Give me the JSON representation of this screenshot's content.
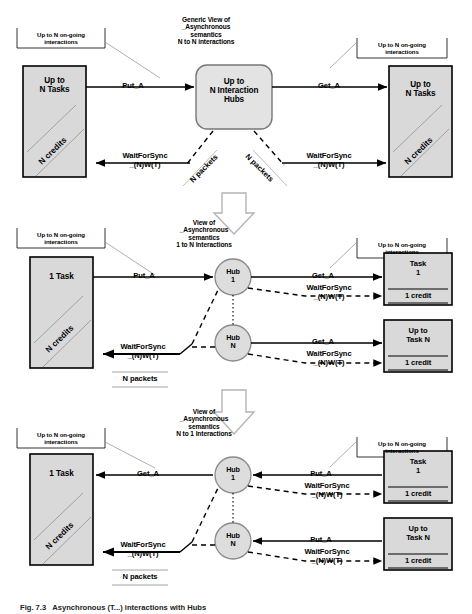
{
  "figure": {
    "caption": "Fig. 7.3   Asynchronous (T...) interactions with Hubs",
    "colors": {
      "box_fill": "#d9d9d9",
      "box_stroke": "#000000",
      "hub_fill": "#dddddd",
      "line": "#000000",
      "leader": "#9a9a9a",
      "arrow_outline": "#b0b0b0",
      "page_bg": "#ffffff"
    }
  },
  "panels": [
    {
      "id": "panel-generic-n-to-n",
      "title": "Generic View of\n_Asynchronous\nsemantics\nN to N interactions",
      "left_note": "Up to N on-going\ninteractions",
      "right_note": "Up to N on-going\ninteractions",
      "left_box": {
        "label": "Up to\nN Tasks",
        "diagonal": "N credits"
      },
      "center_box": {
        "label": "Up to\nN Interaction\nHubs"
      },
      "right_box": {
        "label": "Up to\nN Tasks",
        "diagonal": "N credits"
      },
      "edges": {
        "top_left": "Put_A",
        "top_right": "Get_A",
        "bottom_left": "WaitForSync\n_(N)W(T)",
        "bottom_right": "WaitForSync\n_(N)W(T)",
        "packets_left": "N packets",
        "packets_right": "N packets"
      }
    },
    {
      "id": "panel-1-to-n",
      "title": "View of\n_Asynchronous\nsemantics\n1 to N Interactions",
      "left_note": "Up to N on-going\ninteractions",
      "right_note": "Up to N on-going\ninteractions",
      "left_box": {
        "label": "1 Task",
        "diagonal": "N credits"
      },
      "hubs": [
        {
          "label": "Hub\n1"
        },
        {
          "label": "Hub\nN"
        }
      ],
      "right_boxes": [
        {
          "label": "Task\n1",
          "credit": "1 credit"
        },
        {
          "label": "Up to\nTask N",
          "credit": "1 credit"
        }
      ],
      "edges": {
        "in_put": "Put_A",
        "hub1_get": "Get_A",
        "hub1_wait": "WaitForSync\n_(N)W(T)",
        "hubN_get": "Get_A",
        "hubN_wait": "WaitForSync\n_(N)W(T)",
        "back_wait": "WaitForSync\n_(N)W(T)",
        "packets": "N packets"
      }
    },
    {
      "id": "panel-n-to-1",
      "title": "View of\n_Asynchronous\nsemantics\nN to 1 Interactions",
      "left_note": "Up to N on-going\ninteractions",
      "right_note": "Up to N on-going\ninteractions",
      "left_box": {
        "label": "1 Task",
        "diagonal": "N credits"
      },
      "hubs": [
        {
          "label": "Hub\n1"
        },
        {
          "label": "Hub\nN"
        }
      ],
      "right_boxes": [
        {
          "label": "Task\n1",
          "credit": "1 credit"
        },
        {
          "label": "Up to\nTask N",
          "credit": "1 credit"
        }
      ],
      "edges": {
        "out_get": "Get_A",
        "hub1_put": "Put_A",
        "hub1_wait": "WaitForSync\n_(N)W(T)",
        "hubN_put": "Put_A",
        "hubN_wait": "WaitForSync\n_(N)W(T)",
        "back_wait": "WaitForSync\n_(N)W(T)",
        "packets": "N packets"
      }
    }
  ]
}
